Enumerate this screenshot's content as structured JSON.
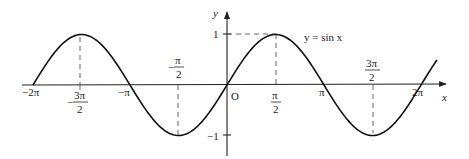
{
  "chart_data": {
    "type": "line",
    "title": "",
    "curve_label": "y = sin x",
    "xlabel": "x",
    "ylabel": "y",
    "origin_label": "O",
    "xlim": [
      -6.2832,
      6.8
    ],
    "ylim": [
      -1.15,
      1.5
    ],
    "grid": false,
    "legend": "none",
    "x_ticks": [
      {
        "value": -6.2832,
        "label": "−2π"
      },
      {
        "value": -4.7124,
        "num": "3π",
        "den": "2",
        "sign": "−"
      },
      {
        "value": -3.1416,
        "label": "−π"
      },
      {
        "value": -1.5708,
        "num": "π",
        "den": "2",
        "sign": "−"
      },
      {
        "value": 1.5708,
        "num": "π",
        "den": "2",
        "sign": ""
      },
      {
        "value": 3.1416,
        "label": "π"
      },
      {
        "value": 4.7124,
        "num": "3π",
        "den": "2",
        "sign": ""
      },
      {
        "value": 6.2832,
        "label": "2π"
      }
    ],
    "y_ticks": [
      {
        "value": 1,
        "label": "1"
      },
      {
        "value": -1,
        "label": "−1"
      }
    ],
    "series": [
      {
        "name": "y = sin x",
        "x": [
          -6.2832,
          -5.4978,
          -4.7124,
          -3.927,
          -3.1416,
          -2.3562,
          -1.5708,
          -0.7854,
          0,
          0.7854,
          1.5708,
          2.3562,
          3.1416,
          3.927,
          4.7124,
          5.4978,
          6.2832,
          6.8
        ],
        "y": [
          0,
          0.7071,
          1,
          0.7071,
          0,
          -0.7071,
          -1,
          -0.7071,
          0,
          0.7071,
          1,
          0.7071,
          0,
          -0.7071,
          -1,
          -0.7071,
          0,
          0.4937
        ]
      }
    ],
    "annotations": [
      {
        "type": "dashed-guide",
        "x": -4.7124,
        "y": 1
      },
      {
        "type": "dashed-guide",
        "x": -1.5708,
        "y": -1
      },
      {
        "type": "dashed-guide",
        "x": 1.5708,
        "y": 1,
        "horizontal_to_y_axis": true
      },
      {
        "type": "dashed-guide",
        "x": 4.7124,
        "y": -1
      }
    ]
  }
}
